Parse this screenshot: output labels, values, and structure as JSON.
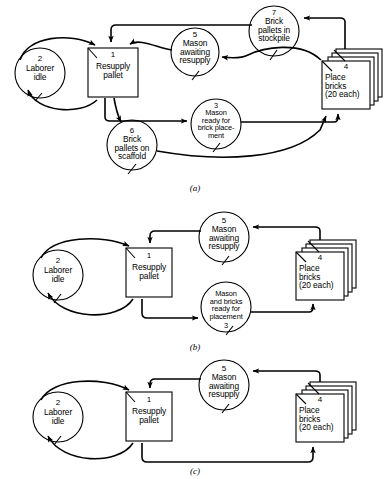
{
  "figure": {
    "ink_color": "#000000",
    "background_color": "#ffffff",
    "panels": [
      {
        "caption": "(a)",
        "nodes": [
          {
            "id": "2",
            "shape": "circle",
            "number": "2",
            "label": "Laborer\nidle"
          },
          {
            "id": "1",
            "shape": "rect",
            "number": "1",
            "label": "Resupply\npallet"
          },
          {
            "id": "5",
            "shape": "circle",
            "number": "5",
            "label": "Mason\nawaiting\nresupply"
          },
          {
            "id": "7",
            "shape": "circle",
            "number": "7",
            "label": "Brick\npallets in\nstockpile"
          },
          {
            "id": "4",
            "shape": "stacked-rect",
            "number": "4",
            "label": "Place\nbricks\n(20 each)"
          },
          {
            "id": "3",
            "shape": "circle",
            "number": "3",
            "label": "Mason\nready for\nbrick place-\nment"
          },
          {
            "id": "6",
            "shape": "circle",
            "number": "6",
            "label": "Brick\npallets on\nscaffold"
          }
        ]
      },
      {
        "caption": "(b)",
        "nodes": [
          {
            "id": "2",
            "shape": "circle",
            "number": "2",
            "label": "Laborer\nidle"
          },
          {
            "id": "1",
            "shape": "rect",
            "number": "1",
            "label": "Resupply\npallet"
          },
          {
            "id": "5",
            "shape": "circle",
            "number": "5",
            "label": "Mason\nawaiting\nresupply"
          },
          {
            "id": "4",
            "shape": "stacked-rect",
            "number": "4",
            "label": "Place\nbricks\n(20 each)"
          },
          {
            "id": "3",
            "shape": "circle",
            "number": "3",
            "label": "Mason\nand bricks\nready for\nplacement"
          }
        ]
      },
      {
        "caption": "(c)",
        "nodes": [
          {
            "id": "2",
            "shape": "circle",
            "number": "2",
            "label": "Laborer\nidle"
          },
          {
            "id": "1",
            "shape": "rect",
            "number": "1",
            "label": "Resupply\npallet"
          },
          {
            "id": "5",
            "shape": "circle",
            "number": "5",
            "label": "Mason\nawaiting\nresupply"
          },
          {
            "id": "4",
            "shape": "stacked-rect",
            "number": "4",
            "label": "Place\nbricks\n(20 each)"
          }
        ]
      }
    ]
  },
  "panel_a": {
    "caption": "(a)",
    "n2_num": "2",
    "n2_l1": "Laborer",
    "n2_l2": "idle",
    "n1_num": "1",
    "n1_l1": "Resupply",
    "n1_l2": "pallet",
    "n5_num": "5",
    "n5_l1": "Mason",
    "n5_l2": "awaiting",
    "n5_l3": "resupply",
    "n7_num": "7",
    "n7_l1": "Brick",
    "n7_l2": "pallets in",
    "n7_l3": "stockpile",
    "n4_num": "4",
    "n4_l1": "Place",
    "n4_l2": "bricks",
    "n4_l3": "(20 each)",
    "n3_num": "3",
    "n3_l1": "Mason",
    "n3_l2": "ready for",
    "n3_l3": "brick place-",
    "n3_l4": "ment",
    "n6_num": "6",
    "n6_l1": "Brick",
    "n6_l2": "pallets on",
    "n6_l3": "scaffold"
  },
  "panel_b": {
    "caption": "(b)",
    "n2_num": "2",
    "n2_l1": "Laborer",
    "n2_l2": "idle",
    "n1_num": "1",
    "n1_l1": "Resupply",
    "n1_l2": "pallet",
    "n5_num": "5",
    "n5_l1": "Mason",
    "n5_l2": "awaiting",
    "n5_l3": "resupply",
    "n4_num": "4",
    "n4_l1": "Place",
    "n4_l2": "bricks",
    "n4_l3": "(20 each)",
    "n3_num": "3",
    "n3_l1": "Mason",
    "n3_l2": "and bricks",
    "n3_l3": "ready for",
    "n3_l4": "placement"
  },
  "panel_c": {
    "caption": "(c)",
    "n2_num": "2",
    "n2_l1": "Laborer",
    "n2_l2": "idle",
    "n1_num": "1",
    "n1_l1": "Resupply",
    "n1_l2": "pallet",
    "n5_num": "5",
    "n5_l1": "Mason",
    "n5_l2": "awaiting",
    "n5_l3": "resupply",
    "n4_num": "4",
    "n4_l1": "Place",
    "n4_l2": "bricks",
    "n4_l3": "(20 each)"
  }
}
